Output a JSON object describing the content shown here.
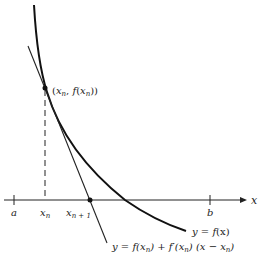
{
  "diagram": {
    "point_label": "(x_n, f(x_n))",
    "point_label_parts": {
      "open": "(",
      "x": "x",
      "n": "n",
      "comma": ", ",
      "f": "f",
      "open2": "(",
      "x2": "x",
      "n2": "n",
      "close": "))"
    },
    "curve_label": {
      "text": "y = f(x)",
      "y": "y",
      "eq": " = ",
      "f": "f",
      "paren": "(x)"
    },
    "tangent_label": {
      "text": "y = f(x_n) + f′(x_n) (x − x_n)",
      "p1": "y = f(x",
      "s1": "n",
      "p2": ") + f′(x",
      "s2": "n",
      "p3": ") (x − x",
      "s3": "n",
      "p4": ")"
    },
    "axis": {
      "x_label": "x",
      "ticks": [
        {
          "label": "a",
          "x": 14
        },
        {
          "label": "x_n",
          "x": 45
        },
        {
          "label": "x_n+1",
          "x": 90
        },
        {
          "label": "b",
          "x": 210
        }
      ],
      "tick_a": "a",
      "tick_xn": "x",
      "tick_xn_sub": "n",
      "tick_xn1": "x",
      "tick_xn1_sub": "n + 1",
      "tick_b": "b"
    },
    "colors": {
      "ink": "#222222",
      "background": "#ffffff"
    }
  }
}
